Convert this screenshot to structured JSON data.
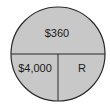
{
  "diagram": {
    "type": "interest-circle",
    "colors": {
      "fill": "#c8c8c8",
      "stroke": "#2a2a2a",
      "text": "#1a1a1a"
    },
    "top": {
      "label": "$360",
      "role": "Interest"
    },
    "bottom_left": {
      "label": "$4,000",
      "role": "Principal"
    },
    "bottom_right": {
      "label": "R",
      "role": "Rate"
    }
  }
}
